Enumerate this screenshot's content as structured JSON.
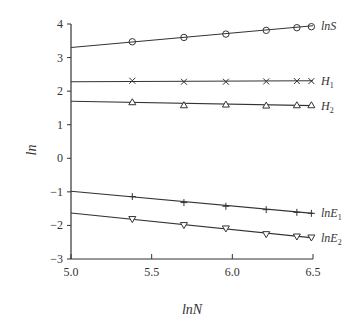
{
  "chart_data": {
    "type": "line",
    "title": "",
    "xlabel": "lnN",
    "ylabel": "ln",
    "xlim": [
      5.0,
      6.5
    ],
    "ylim": [
      -3,
      4
    ],
    "xticks": [
      "5.0",
      "5.5",
      "6.0",
      "6.5"
    ],
    "yticks": [
      "−3",
      "−2",
      "−1",
      "0",
      "1",
      "2",
      "3",
      "4"
    ],
    "grid": false,
    "legend": "inline labels at right end of each line",
    "x": [
      5.38,
      5.7,
      5.96,
      6.21,
      6.4,
      6.49
    ],
    "series": [
      {
        "name": "lnS",
        "label_main": "lnS",
        "label_sub": "",
        "marker": "circle",
        "values": [
          3.47,
          3.6,
          3.7,
          3.81,
          3.89,
          3.92
        ],
        "fit": {
          "x0": 5.0,
          "y0": 3.3,
          "x1": 6.5,
          "y1": 3.95
        }
      },
      {
        "name": "H1",
        "label_main": "H",
        "label_sub": "1",
        "marker": "x",
        "values": [
          2.31,
          2.28,
          2.28,
          2.29,
          2.3,
          2.3
        ],
        "fit": {
          "x0": 5.0,
          "y0": 2.28,
          "x1": 6.5,
          "y1": 2.31
        }
      },
      {
        "name": "H2",
        "label_main": "H",
        "label_sub": "2",
        "marker": "triangle",
        "values": [
          1.67,
          1.58,
          1.6,
          1.57,
          1.58,
          1.58
        ],
        "fit": {
          "x0": 5.0,
          "y0": 1.7,
          "x1": 6.5,
          "y1": 1.57
        }
      },
      {
        "name": "lnE1",
        "label_main": "lnE",
        "label_sub": "1",
        "marker": "plus",
        "values": [
          -1.14,
          -1.32,
          -1.43,
          -1.53,
          -1.61,
          -1.64
        ],
        "fit": {
          "x0": 5.0,
          "y0": -0.98,
          "x1": 6.5,
          "y1": -1.64
        }
      },
      {
        "name": "lnE2",
        "label_main": "lnE",
        "label_sub": "2",
        "marker": "triangle-down",
        "values": [
          -1.81,
          -1.99,
          -2.09,
          -2.26,
          -2.33,
          -2.36
        ],
        "fit": {
          "x0": 5.0,
          "y0": -1.63,
          "x1": 6.5,
          "y1": -2.37
        }
      }
    ]
  }
}
